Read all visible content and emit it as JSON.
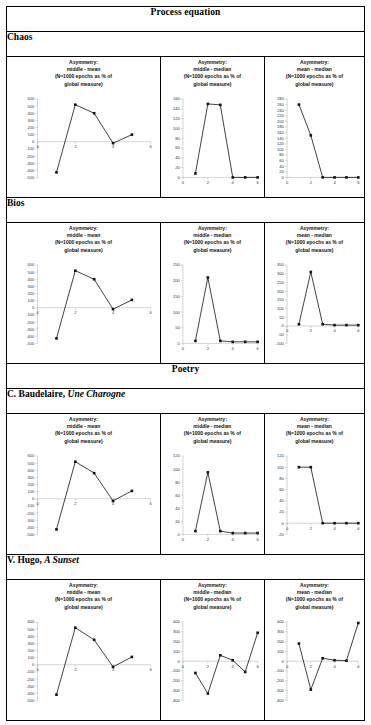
{
  "figure": {
    "sections": [
      {
        "id": "process-equation",
        "label": "Process equation"
      },
      {
        "id": "poetry",
        "label": "Poetry"
      }
    ],
    "row_labels": [
      {
        "id": "chaos",
        "plain": "Chaos",
        "italic": ""
      },
      {
        "id": "bios",
        "plain": "Bios",
        "italic": ""
      },
      {
        "id": "baudelaire",
        "plain": "C. Baudelaire, ",
        "italic": "Une Charogne"
      },
      {
        "id": "hugo",
        "plain": "V. Hugo, ",
        "italic": "A Sunset"
      }
    ],
    "column_measures": [
      "middle - mean",
      "middle - median",
      "mean - median"
    ],
    "title_prefix": "Asymmetry:",
    "title_note": "(N=1000 epochs as % of",
    "title_note2": "global measure)"
  },
  "chart_data": [
    {
      "id": "chaos-middle-mean",
      "type": "line",
      "title": "Asymmetry: middle - mean (N=1000 epochs as % of global measure)",
      "xlabel": "",
      "ylabel": "",
      "x": [
        1,
        2,
        3,
        4,
        5
      ],
      "values": [
        -430,
        520,
        400,
        -20,
        100
      ],
      "xlim": [
        0,
        6
      ],
      "ylim": [
        -500,
        600
      ],
      "xticks": [
        0,
        2,
        4,
        6
      ],
      "yticks": [
        600,
        500,
        400,
        300,
        200,
        100,
        0,
        -100,
        -200,
        -300,
        -400,
        -500
      ],
      "grid": false,
      "legend": "none"
    },
    {
      "id": "chaos-middle-median",
      "type": "line",
      "title": "Asymmetry: middle - median (N=1000 epochs as % of global measure)",
      "xlabel": "",
      "ylabel": "",
      "x": [
        1,
        2,
        3,
        4,
        5,
        6
      ],
      "values": [
        8,
        150,
        148,
        0,
        0,
        0
      ],
      "xlim": [
        0,
        6
      ],
      "ylim": [
        0,
        160
      ],
      "xticks": [
        0,
        2,
        4,
        6
      ],
      "yticks": [
        160,
        140,
        120,
        100,
        80,
        60,
        40,
        20,
        0
      ],
      "grid": false,
      "legend": "none"
    },
    {
      "id": "chaos-mean-median",
      "type": "line",
      "title": "Asymmetry: mean - median (N=1000 epochs as % of global measure)",
      "xlabel": "",
      "ylabel": "",
      "x": [
        1,
        2,
        3,
        4,
        5,
        6
      ],
      "values": [
        260,
        150,
        0,
        0,
        0,
        0
      ],
      "xlim": [
        0,
        6
      ],
      "ylim": [
        0,
        280
      ],
      "xticks": [
        0,
        2,
        4,
        6
      ],
      "yticks": [
        280,
        260,
        240,
        220,
        200,
        180,
        160,
        140,
        120,
        100,
        80,
        60,
        40,
        20,
        0
      ],
      "grid": false,
      "legend": "none"
    },
    {
      "id": "bios-middle-mean",
      "type": "line",
      "title": "Asymmetry: middle - mean (N=1000 epochs as % of global measure)",
      "xlabel": "",
      "ylabel": "",
      "x": [
        1,
        2,
        3,
        4,
        5
      ],
      "values": [
        -430,
        520,
        400,
        -20,
        110
      ],
      "xlim": [
        0,
        6
      ],
      "ylim": [
        -500,
        600
      ],
      "xticks": [
        0,
        2,
        4,
        6
      ],
      "yticks": [
        600,
        500,
        400,
        300,
        200,
        100,
        0,
        -100,
        -200,
        -300,
        -400,
        -500
      ],
      "grid": false,
      "legend": "none"
    },
    {
      "id": "bios-middle-median",
      "type": "line",
      "title": "Asymmetry: middle - median (N=1000 epochs as % of global measure)",
      "xlabel": "",
      "ylabel": "",
      "x": [
        1,
        2,
        3,
        4,
        5,
        6
      ],
      "values": [
        8,
        210,
        8,
        5,
        5,
        5
      ],
      "xlim": [
        0,
        6
      ],
      "ylim": [
        0,
        250
      ],
      "xticks": [
        0,
        2,
        4,
        6
      ],
      "yticks": [
        250,
        200,
        150,
        100,
        50,
        0
      ],
      "grid": false,
      "legend": "none"
    },
    {
      "id": "bios-mean-median",
      "type": "line",
      "title": "Asymmetry: mean - median (N=1000 epochs as % of global measure)",
      "xlabel": "",
      "ylabel": "",
      "x": [
        1,
        2,
        3,
        4,
        5,
        6
      ],
      "values": [
        10,
        310,
        10,
        5,
        5,
        5
      ],
      "xlim": [
        0,
        6
      ],
      "ylim": [
        -100,
        350
      ],
      "xticks": [
        0,
        2,
        4,
        6
      ],
      "yticks": [
        350,
        300,
        250,
        200,
        150,
        100,
        50,
        0,
        -50,
        -100
      ],
      "grid": false,
      "legend": "none"
    },
    {
      "id": "baudelaire-middle-mean",
      "type": "line",
      "title": "Asymmetry: middle - mean (N=1000 epochs as % of global measure)",
      "xlabel": "",
      "ylabel": "",
      "x": [
        1,
        2,
        3,
        4,
        5
      ],
      "values": [
        -430,
        520,
        360,
        -30,
        110
      ],
      "xlim": [
        0,
        6
      ],
      "ylim": [
        -500,
        600
      ],
      "xticks": [
        0,
        2,
        4,
        6
      ],
      "yticks": [
        600,
        500,
        400,
        300,
        200,
        100,
        0,
        -100,
        -200,
        -300,
        -400,
        -500
      ],
      "grid": false,
      "legend": "none"
    },
    {
      "id": "baudelaire-middle-median",
      "type": "line",
      "title": "Asymmetry: middle - median (N=1000 epochs as % of global measure)",
      "xlabel": "",
      "ylabel": "",
      "x": [
        1,
        2,
        3,
        4,
        5,
        6
      ],
      "values": [
        5,
        95,
        5,
        2,
        2,
        2
      ],
      "xlim": [
        0,
        6
      ],
      "ylim": [
        0,
        120
      ],
      "xticks": [
        0,
        2,
        4,
        6
      ],
      "yticks": [
        120,
        100,
        80,
        60,
        40,
        20,
        0
      ],
      "grid": false,
      "legend": "none"
    },
    {
      "id": "baudelaire-mean-median",
      "type": "line",
      "title": "Asymmetry: mean - median (N=1000 epochs as % of global measure)",
      "xlabel": "",
      "ylabel": "",
      "x": [
        1,
        2,
        3,
        4,
        5,
        6
      ],
      "values": [
        100,
        100,
        0,
        0,
        0,
        0
      ],
      "xlim": [
        0,
        6
      ],
      "ylim": [
        -20,
        120
      ],
      "xticks": [
        0,
        2,
        4,
        6
      ],
      "yticks": [
        120,
        100,
        80,
        60,
        40,
        20,
        0,
        -20
      ],
      "grid": false,
      "legend": "none"
    },
    {
      "id": "hugo-middle-mean",
      "type": "line",
      "title": "Asymmetry: middle - mean (N=1000 epochs as % of global measure)",
      "xlabel": "",
      "ylabel": "",
      "x": [
        1,
        2,
        3,
        4,
        5
      ],
      "values": [
        -420,
        520,
        350,
        -30,
        110
      ],
      "xlim": [
        0,
        6
      ],
      "ylim": [
        -500,
        600
      ],
      "xticks": [
        0,
        2,
        4,
        6
      ],
      "yticks": [
        600,
        500,
        400,
        300,
        200,
        100,
        0,
        -100,
        -200,
        -300,
        -400,
        -500
      ],
      "grid": false,
      "legend": "none"
    },
    {
      "id": "hugo-middle-median",
      "type": "line",
      "title": "Asymmetry: middle - median (N=1000 epochs as % of global measure)",
      "xlabel": "",
      "ylabel": "",
      "x": [
        1,
        2,
        3,
        4,
        5,
        6
      ],
      "values": [
        -120,
        -330,
        60,
        10,
        -110,
        290
      ],
      "xlim": [
        0,
        6
      ],
      "ylim": [
        -400,
        400
      ],
      "xticks": [
        0,
        2,
        4,
        6
      ],
      "yticks": [
        400,
        300,
        200,
        100,
        0,
        -100,
        -200,
        -300,
        -400
      ],
      "grid": false,
      "legend": "none"
    },
    {
      "id": "hugo-mean-median",
      "type": "line",
      "title": "Asymmetry: mean - median (N=1000 epochs as % of global measure)",
      "xlabel": "",
      "ylabel": "",
      "x": [
        1,
        2,
        3,
        4,
        5,
        6
      ],
      "values": [
        180,
        -290,
        30,
        10,
        5,
        390
      ],
      "xlim": [
        0,
        6
      ],
      "ylim": [
        -400,
        400
      ],
      "xticks": [
        0,
        2,
        4,
        6
      ],
      "yticks": [
        400,
        300,
        200,
        100,
        0,
        -100,
        -200,
        -300,
        -400
      ],
      "grid": false,
      "legend": "none"
    }
  ]
}
